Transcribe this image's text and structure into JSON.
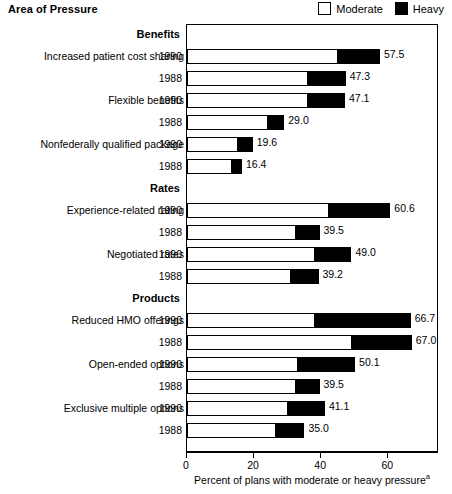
{
  "header": {
    "area_title": "Area of Pressure",
    "legend": [
      {
        "name": "moderate",
        "label": "Moderate",
        "color": "#ffffff"
      },
      {
        "name": "heavy",
        "label": "Heavy",
        "color": "#000000"
      }
    ]
  },
  "axis": {
    "xlabel": "Percent of plans with moderate or heavy pressure",
    "xlabel_footnote": "a",
    "ticks": [
      0,
      20,
      40,
      60
    ],
    "tick_labels": [
      "0",
      "20",
      "40",
      "60"
    ],
    "xmin": 0,
    "xmax": 75
  },
  "chart_data": {
    "type": "bar",
    "orientation": "horizontal",
    "stacked": true,
    "title": "Area of Pressure",
    "xlabel": "Percent of plans with moderate or heavy pressure",
    "ylabel": "",
    "xlim": [
      0,
      75
    ],
    "xticks": [
      0,
      20,
      40,
      60
    ],
    "grid": false,
    "legend_position": "top-right",
    "series": [
      {
        "name": "Moderate",
        "color": "#ffffff"
      },
      {
        "name": "Heavy",
        "color": "#000000"
      }
    ],
    "sections": [
      {
        "section": "Benefits",
        "rows": [
          {
            "category": "Increased patient cost sharing",
            "year": "1990",
            "moderate": 45.0,
            "heavy": 12.5,
            "total": 57.5,
            "total_label": "57.5"
          },
          {
            "category": "",
            "year": "1988",
            "moderate": 36.0,
            "heavy": 11.3,
            "total": 47.3,
            "total_label": "47.3"
          },
          {
            "category": "Flexible benefits",
            "year": "1990",
            "moderate": 36.0,
            "heavy": 11.1,
            "total": 47.1,
            "total_label": "47.1"
          },
          {
            "category": "",
            "year": "1988",
            "moderate": 24.0,
            "heavy": 5.0,
            "total": 29.0,
            "total_label": "29.0"
          },
          {
            "category": "Nonfederally qualified package",
            "year": "1990",
            "moderate": 15.2,
            "heavy": 4.4,
            "total": 19.6,
            "total_label": "19.6"
          },
          {
            "category": "",
            "year": "1988",
            "moderate": 13.2,
            "heavy": 3.2,
            "total": 16.4,
            "total_label": "16.4"
          }
        ]
      },
      {
        "section": "Rates",
        "rows": [
          {
            "category": "Experience-related rating",
            "year": "1990",
            "moderate": 42.0,
            "heavy": 18.6,
            "total": 60.6,
            "total_label": "60.6"
          },
          {
            "category": "",
            "year": "1988",
            "moderate": 32.5,
            "heavy": 7.0,
            "total": 39.5,
            "total_label": "39.5"
          },
          {
            "category": "Negotiated rates",
            "year": "1990",
            "moderate": 38.0,
            "heavy": 11.0,
            "total": 49.0,
            "total_label": "49.0"
          },
          {
            "category": "",
            "year": "1988",
            "moderate": 31.0,
            "heavy": 8.2,
            "total": 39.2,
            "total_label": "39.2"
          }
        ]
      },
      {
        "section": "Products",
        "rows": [
          {
            "category": "Reduced HMO offerings",
            "year": "1990",
            "moderate": 38.0,
            "heavy": 28.7,
            "total": 66.7,
            "total_label": "66.7"
          },
          {
            "category": "",
            "year": "1988",
            "moderate": 49.0,
            "heavy": 18.0,
            "total": 67.0,
            "total_label": "67.0"
          },
          {
            "category": "Open-ended options",
            "year": "1990",
            "moderate": 33.0,
            "heavy": 17.1,
            "total": 50.1,
            "total_label": "50.1"
          },
          {
            "category": "",
            "year": "1988",
            "moderate": 32.5,
            "heavy": 7.0,
            "total": 39.5,
            "total_label": "39.5"
          },
          {
            "category": "Exclusive multiple options",
            "year": "1990",
            "moderate": 30.0,
            "heavy": 11.1,
            "total": 41.1,
            "total_label": "41.1"
          },
          {
            "category": "",
            "year": "1988",
            "moderate": 26.5,
            "heavy": 8.5,
            "total": 35.0,
            "total_label": "35.0"
          }
        ]
      }
    ]
  }
}
